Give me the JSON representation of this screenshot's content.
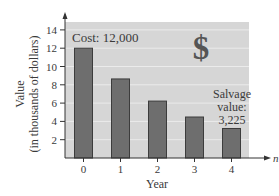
{
  "chart_data": {
    "type": "bar",
    "title": "",
    "xlabel": "Year",
    "ylabel": "Value",
    "ylabel_sub": "(in thousands of dollars)",
    "x_axis_variable": "n",
    "categories": [
      "0",
      "1",
      "2",
      "3",
      "4"
    ],
    "values": [
      12,
      8.64,
      6.22,
      4.48,
      3.225
    ],
    "yticks": [
      2,
      4,
      6,
      8,
      10,
      12,
      14
    ],
    "ylim": [
      0,
      15
    ],
    "grid": true,
    "legend": null,
    "annotations": [
      {
        "text": "Cost: 12,000",
        "target_category": "0"
      },
      {
        "text_lines": [
          "Salvage",
          "value:",
          "3,225"
        ],
        "target_category": "4"
      },
      {
        "text": "$",
        "role": "decorative-dollar-sign"
      }
    ]
  },
  "colors": {
    "plot_background": "#d6d6d6",
    "gridline": "#ebebeb",
    "bar_fill": "#6e6e6e",
    "bar_stroke": "#3c3c3c",
    "axis": "#333333",
    "dollar_sign": "#555555"
  },
  "labels": {
    "cost": "Cost: 12,000",
    "salvage_1": "Salvage",
    "salvage_2": "value:",
    "salvage_3": "3,225",
    "dollar": "$",
    "x_axis_title": "Year",
    "x_axis_variable": "n",
    "y_axis_title_1": "Value",
    "y_axis_title_2": "(in thousands of dollars)"
  }
}
